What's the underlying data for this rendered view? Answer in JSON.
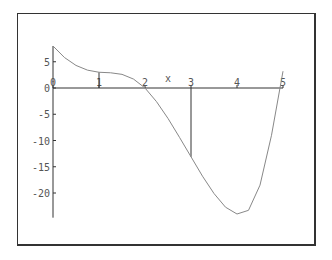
{
  "chart_data": {
    "type": "line",
    "title": "",
    "xlabel": "x",
    "ylabel": "",
    "x_ticks": [
      "0",
      "1",
      "2",
      "3",
      "4",
      "5"
    ],
    "y_ticks": [
      "5",
      "0",
      "-5",
      "-10",
      "-15",
      "-20"
    ],
    "xlim": [
      0,
      5
    ],
    "ylim": [
      -24.7,
      8
    ],
    "grid": false,
    "series": [
      {
        "name": "f(x)",
        "x": [
          0,
          0.25,
          0.5,
          0.75,
          1,
          1.25,
          1.5,
          1.75,
          2,
          2.25,
          2.5,
          2.75,
          3,
          3.25,
          3.5,
          3.75,
          4,
          4.25,
          4.5,
          4.75,
          5
        ],
        "values": [
          8,
          5.8,
          4.3,
          3.4,
          3.0,
          2.9,
          2.6,
          1.7,
          0,
          -2.6,
          -5.8,
          -9.4,
          -13.1,
          -16.8,
          -20.1,
          -22.7,
          -24.0,
          -23.3,
          -18.5,
          -9,
          3.2
        ]
      }
    ],
    "annotations": [
      {
        "type": "vline",
        "x": 1,
        "from": 0,
        "to": 3.0
      },
      {
        "type": "vline",
        "x": 3,
        "from": 0,
        "to": -13.1
      }
    ]
  }
}
